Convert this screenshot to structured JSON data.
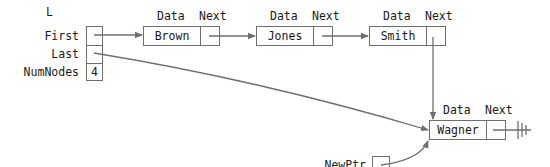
{
  "list": {
    "name": "L",
    "fields": [
      {
        "label": "First",
        "value": ""
      },
      {
        "label": "Last",
        "value": ""
      },
      {
        "label": "NumNodes",
        "value": "4"
      }
    ]
  },
  "field_headers": {
    "data": "Data",
    "next": "Next"
  },
  "nodes": [
    {
      "data": "Brown"
    },
    {
      "data": "Jones"
    },
    {
      "data": "Smith"
    },
    {
      "data": "Wagner"
    }
  ],
  "new_ptr": {
    "label": "NewPtr"
  },
  "colors": {
    "line": "#6e6e6e",
    "text": "#1a1a1a",
    "background": "#ffffff"
  }
}
